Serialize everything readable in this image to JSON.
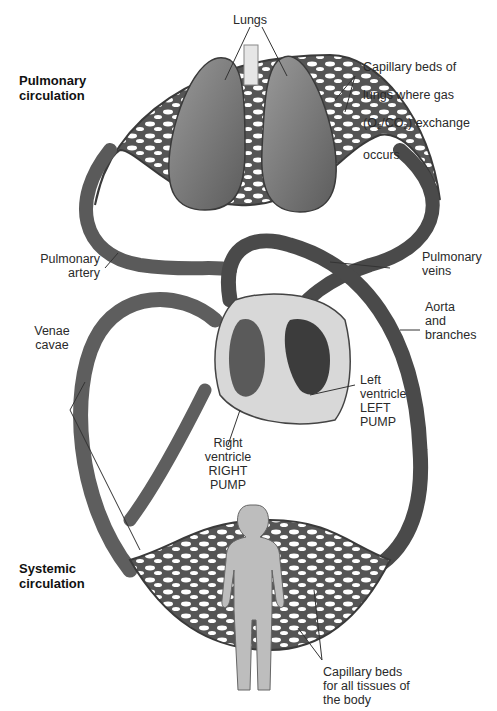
{
  "diagram": {
    "type": "circulatory-system",
    "sections": {
      "pulmonary": "Pulmonary\ncirculation",
      "systemic": "Systemic\ncirculation"
    },
    "labels": {
      "lungs": "Lungs",
      "lung_capillaries_1": "Capillary beds of",
      "lung_capillaries_2": "lungs where gas",
      "lung_capillaries_3_pre": "(O",
      "lung_capillaries_3_sub1": "2",
      "lung_capillaries_3_mid": "/CO",
      "lung_capillaries_3_sub2": "2",
      "lung_capillaries_3_post": ") exchange",
      "lung_capillaries_4": "occurs",
      "pulmonary_artery": "Pulmonary\nartery",
      "pulmonary_veins": "Pulmonary\nveins",
      "aorta": "Aorta\nand\nbranches",
      "venae_cavae": "Venae\ncavae",
      "left_ventricle": "Left\nventricle\nLEFT\nPUMP",
      "right_ventricle": "Right\nventricle\nRIGHT\nPUMP",
      "body_capillaries": "Capillary beds\nfor all tissues of\nthe body"
    },
    "colors": {
      "vessel": "#5a5a5a",
      "vessel_dark": "#3a3a3a",
      "organ": "#7a7a7a",
      "heart_bg": "#d8d8d8",
      "body": "#bdbdbd",
      "leader": "#333333"
    }
  }
}
